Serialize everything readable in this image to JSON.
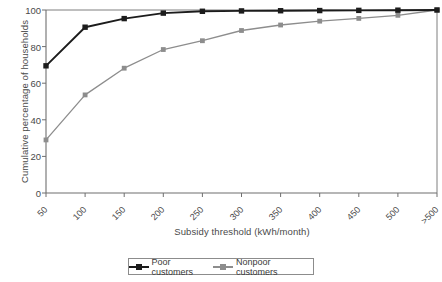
{
  "chart_data": {
    "type": "line",
    "title": "",
    "xlabel": "Subsidy threshold (kWh/month)",
    "ylabel": "Cumulative percentage of households",
    "categories": [
      "50",
      "100",
      "150",
      "200",
      "250",
      "300",
      "350",
      "400",
      "450",
      "500",
      ">500"
    ],
    "xtick_labels": [
      "50",
      "100",
      "150",
      "200",
      "250",
      "300",
      "350",
      "400",
      "450",
      "500",
      ">500"
    ],
    "ytick_labels": [
      "0",
      "20",
      "40",
      "60",
      "80",
      "100"
    ],
    "ytick_values": [
      0,
      20,
      40,
      60,
      80,
      100
    ],
    "ylim": [
      0,
      100
    ],
    "grid": false,
    "legend_position": "bottom",
    "series": [
      {
        "name": "Poor customers",
        "color": "#1c1c1c",
        "marker": "square",
        "values": [
          69.5,
          90.6,
          95.3,
          98.3,
          99.3,
          99.5,
          99.6,
          99.7,
          99.8,
          99.9,
          100
        ]
      },
      {
        "name": "Nonpoor customers",
        "color": "#8d8d8d",
        "marker": "square",
        "values": [
          29.0,
          53.6,
          68.2,
          78.4,
          83.2,
          88.8,
          91.8,
          93.9,
          95.4,
          97.1,
          100
        ]
      }
    ]
  },
  "legend": {
    "entries": [
      {
        "label": "Poor customers",
        "color": "#1c1c1c"
      },
      {
        "label": "Nonpoor customers",
        "color": "#8d8d8d"
      }
    ]
  },
  "axes": {
    "x_title": "Subsidy threshold (kWh/month)",
    "y_title": "Cumulative percentage of households"
  }
}
